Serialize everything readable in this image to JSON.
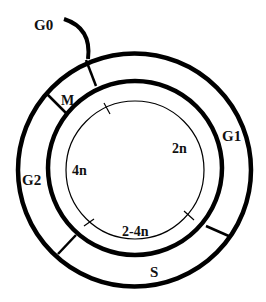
{
  "diagram": {
    "phases": [
      {
        "id": "G0",
        "label": "G0"
      },
      {
        "id": "M",
        "label": "M"
      },
      {
        "id": "G1",
        "label": "G1"
      },
      {
        "id": "S",
        "label": "S"
      },
      {
        "id": "G2",
        "label": "G2"
      }
    ],
    "ploidy": [
      {
        "id": "2n",
        "label": "2n"
      },
      {
        "id": "4n",
        "label": "4n"
      },
      {
        "id": "2-4n",
        "label": "2-4n"
      }
    ],
    "colors": {
      "stroke": "#000000",
      "background": "#ffffff",
      "text": "#111111"
    }
  }
}
